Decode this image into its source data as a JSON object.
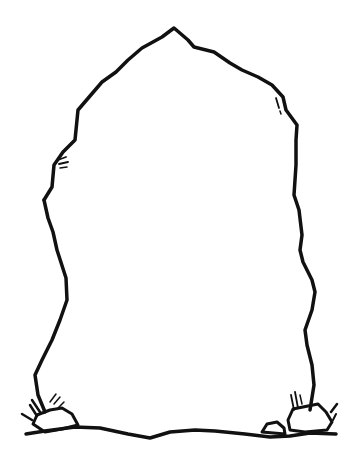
{
  "illustration": {
    "subject": "standing stone outline with small rocks and grass tufts at base",
    "ink_color": "#111111",
    "background": "#ffffff",
    "stone_outline": "M 44 200 L 52 187 L 54 165 L 63 152 L 75 140 L 78 110 L 90 96 L 102 82 L 116 72 L 128 60 L 142 48 L 162 37 L 174 28 L 188 40 L 194 47 L 214 52 L 230 63 L 242 70 L 258 77 L 272 85 L 283 97 L 286 110 L 297 125 L 296 140 L 296 165 L 294 195 L 299 210 L 302 235 L 300 250 L 303 262 L 312 280 L 315 292 L 312 310 L 305 330 L 307 345 L 312 365 L 314 385 L 310 410",
    "stone_left_side": "M 44 200 L 48 218 L 53 232 L 57 250 L 66 278 L 67 300 L 60 320 L 52 340 L 42 360 L 35 375 L 38 395 L 45 412",
    "ground_line": "M 26 434 L 45 431 L 75 427 L 100 428 L 128 434 L 150 438 L 170 432 L 195 430 L 215 431 L 245 434 L 270 437 L 290 436 L 310 433 L 336 434",
    "left_rock": "M 33 424 L 37 415 L 50 410 L 62 408 L 72 414 L 78 425 L 62 429 L 45 432 Z",
    "right_rock_large": "M 288 420 L 293 409 L 308 406 L 318 404 L 326 412 L 332 422 L 327 430 L 305 432 L 290 430 Z",
    "right_rock_small": "M 262 432 L 267 424 L 277 422 L 284 428 L 285 434 Z",
    "grass_left": [
      "M 30 405 L 37 416",
      "M 22 414 L 32 420",
      "M 32 400 L 40 412",
      "M 50 402 L 56 394",
      "M 54 404 L 60 397",
      "M 58 408 L 64 402"
    ],
    "grass_right": [
      "M 291 395 L 294 410",
      "M 295 392 L 298 408",
      "M 300 395 L 302 404",
      "M 331 412 L 337 404",
      "M 333 420 L 336 414"
    ],
    "texture_left": [
      "M 58 160 L 66 157",
      "M 59 164 L 68 162",
      "M 60 168 L 67 167"
    ],
    "texture_right": [
      "M 276 98 L 279 108",
      "M 280 111 L 281 114"
    ]
  }
}
